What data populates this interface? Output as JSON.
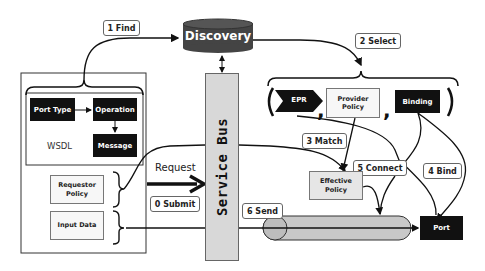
{
  "diagram": {
    "discovery": {
      "label": "Discovery",
      "color": "#444444"
    },
    "service_bus": {
      "label": "Service Bus",
      "color": "#d8d8d8"
    },
    "wsdl": {
      "label": "WSDL",
      "port_type": "Port Type",
      "operation": "Operation",
      "message": "Message"
    },
    "requestor_policy": "Requestor Policy",
    "input_data": "Input Data",
    "request_label": "Request",
    "selection": {
      "epr": "EPR",
      "provider_policy": "Provider Policy",
      "binding": "Binding",
      "separator": ","
    },
    "effective_policy": "Effective Policy",
    "port": "Port",
    "steps": {
      "submit": "0 Submit",
      "find": "1 Find",
      "select": "2 Select",
      "match": "3 Match",
      "bind": "4 Bind",
      "connect": "5 Connect",
      "send": "6 Send"
    }
  }
}
